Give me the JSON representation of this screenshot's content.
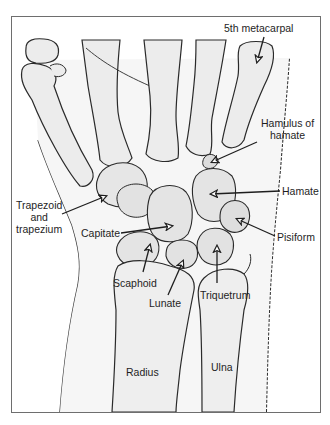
{
  "figure": {
    "colors": {
      "ink": "#1e1e1e",
      "bone_fill": "#ececec",
      "soft_tissue": "#f4f4f4",
      "border": "#6e6e6e"
    }
  },
  "labels": {
    "fifth_metacarpal": "5th metacarpal",
    "hamulus_line1": "Hamulus of",
    "hamulus_line2": "hamate",
    "hamate": "Hamate",
    "pisiform": "Pisiform",
    "trapezoid_line1": "Trapezoid",
    "trapezoid_line2": "and",
    "trapezoid_line3": "trapezium",
    "capitate": "Capitate",
    "scaphoid": "Scaphoid",
    "lunate": "Lunate",
    "triquetrum": "Triquetrum",
    "radius": "Radius",
    "ulna": "Ulna"
  }
}
